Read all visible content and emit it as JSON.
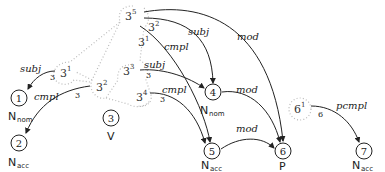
{
  "diagram": {
    "type": "dependency-structure",
    "nodes": [
      {
        "id": "1",
        "label": "1",
        "category": "N",
        "subscript": "nom"
      },
      {
        "id": "2",
        "label": "2",
        "category": "N",
        "subscript": "acc"
      },
      {
        "id": "3",
        "label": "3",
        "category": "V",
        "subscript": ""
      },
      {
        "id": "4",
        "label": "4",
        "category": "N",
        "subscript": "nom"
      },
      {
        "id": "5",
        "label": "5",
        "category": "N",
        "subscript": "acc"
      },
      {
        "id": "6",
        "label": "6",
        "category": "P",
        "subscript": ""
      },
      {
        "id": "7",
        "label": "7",
        "category": "N",
        "subscript": "acc"
      }
    ],
    "valency_slots": [
      {
        "base": "3",
        "exp": "5"
      },
      {
        "base": "3",
        "exp": "1"
      },
      {
        "base": "3",
        "exp": "2"
      },
      {
        "base": "3",
        "exp": "3"
      },
      {
        "base": "3",
        "exp": "4"
      },
      {
        "base": "6",
        "exp": "1"
      }
    ],
    "edge_labels": {
      "subj_left": "subj",
      "cmpl_left": "cmpl",
      "subj_top": "subj",
      "cmpl_top": "cmpl",
      "mod_top": "mod",
      "subj_mid": "subj",
      "cmpl_mid": "cmpl",
      "mod_4_6": "mod",
      "mod_5_6": "mod",
      "pcmpl": "pcmpl"
    },
    "edge_numbers": {
      "n_subj_left": "3",
      "n_cmpl_left": "3",
      "n_subj_mid": "3",
      "n_cmpl_mid": "3",
      "n_pcmpl": "6",
      "top_exp_2": "2",
      "top_exp_1": "1"
    }
  }
}
